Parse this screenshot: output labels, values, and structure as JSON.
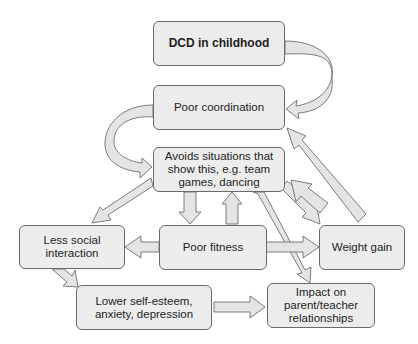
{
  "diagram": {
    "type": "flowchart",
    "nodes": {
      "dcd": "DCD in childhood",
      "poor_coordination": "Poor coordination",
      "avoids": "Avoids situations that\nshow this, e.g. team\ngames, dancing",
      "less_social": "Less social\ninteraction",
      "poor_fitness": "Poor fitness",
      "weight_gain": "Weight gain",
      "lower_self_esteem": "Lower self-esteem,\nanxiety, depression",
      "impact": "Impact on\nparent/teacher\nrelationships"
    },
    "edges": [
      {
        "from": "DCD in childhood",
        "to": "Poor coordination"
      },
      {
        "from": "Poor coordination",
        "to": "Avoids situations that show this, e.g. team games, dancing"
      },
      {
        "from": "Avoids situations that show this, e.g. team games, dancing",
        "to": "Less social interaction"
      },
      {
        "from": "Avoids situations that show this, e.g. team games, dancing",
        "to": "Poor fitness"
      },
      {
        "from": "Poor fitness",
        "to": "Avoids situations that show this, e.g. team games, dancing"
      },
      {
        "from": "Avoids situations that show this, e.g. team games, dancing",
        "to": "Weight gain"
      },
      {
        "from": "Weight gain",
        "to": "Avoids situations that show this, e.g. team games, dancing"
      },
      {
        "from": "Weight gain",
        "to": "Poor coordination"
      },
      {
        "from": "Avoids situations that show this, e.g. team games, dancing",
        "to": "Impact on parent/teacher relationships"
      },
      {
        "from": "Poor fitness",
        "to": "Less social interaction"
      },
      {
        "from": "Poor fitness",
        "to": "Weight gain"
      },
      {
        "from": "Less social interaction",
        "to": "Lower self-esteem, anxiety, depression"
      },
      {
        "from": "Lower self-esteem, anxiety, depression",
        "to": "Impact on parent/teacher relationships"
      }
    ],
    "colors": {
      "box_fill": "#ececec",
      "box_border": "#6a6a6a",
      "arrow_fill": "#e4e4e4",
      "arrow_stroke": "#6e6e6e",
      "text": "#1e1e1e"
    }
  }
}
